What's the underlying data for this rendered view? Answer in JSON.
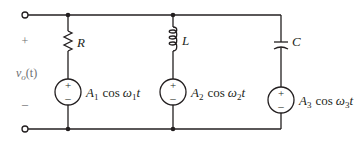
{
  "output": {
    "label": "v",
    "subscript": "o",
    "arg": "(t)",
    "plus": "+",
    "minus": "–"
  },
  "components": {
    "resistor": {
      "label": "R"
    },
    "inductor": {
      "label": "L"
    },
    "capacitor": {
      "label": "C"
    }
  },
  "sources": [
    {
      "amp": "A",
      "amp_sub": "1",
      "func": "cos",
      "omega": "ω",
      "omega_sub": "1",
      "t": "t",
      "plus": "+",
      "minus": "–"
    },
    {
      "amp": "A",
      "amp_sub": "2",
      "func": "cos",
      "omega": "ω",
      "omega_sub": "2",
      "t": "t",
      "plus": "+",
      "minus": "–"
    },
    {
      "amp": "A",
      "amp_sub": "3",
      "func": "cos",
      "omega": "ω",
      "omega_sub": "3",
      "t": "t",
      "plus": "+",
      "minus": "–"
    }
  ],
  "colors": {
    "line": "#231f20",
    "secondary_text": "#6d6e71"
  }
}
